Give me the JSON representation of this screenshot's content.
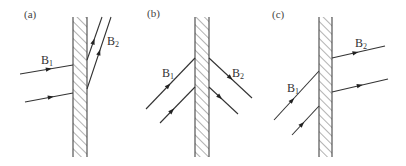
{
  "figure": {
    "width": 406,
    "height": 166,
    "colors": {
      "line": "#333333",
      "hatch": "#555555",
      "background": "#ffffff"
    }
  },
  "panels": [
    {
      "id": "a",
      "label": "(a)",
      "label_pos": [
        24,
        18
      ],
      "slab": {
        "x1": 73,
        "x2": 87,
        "y1": 17,
        "y2": 157
      },
      "incident_label": {
        "text": "B",
        "sub": "1",
        "pos": [
          41,
          64
        ]
      },
      "emergent_label": {
        "text": "B",
        "sub": "2",
        "pos": [
          107,
          45
        ]
      },
      "incident_rays": [
        {
          "from": [
            20,
            74
          ],
          "to": [
            73,
            65
          ],
          "arrow_t": 0.6
        },
        {
          "from": [
            25,
            102
          ],
          "to": [
            73,
            93
          ],
          "arrow_t": 0.6
        }
      ],
      "emergent_rays": [
        {
          "from": [
            87,
            60
          ],
          "to": [
            102,
            17
          ],
          "arrow_t": 0.5
        },
        {
          "from": [
            87,
            89
          ],
          "to": [
            111,
            17
          ],
          "arrow_t": 0.55
        }
      ]
    },
    {
      "id": "b",
      "label": "(b)",
      "label_pos": [
        147,
        17
      ],
      "slab": {
        "x1": 195,
        "x2": 209,
        "y1": 17,
        "y2": 157
      },
      "incident_label": {
        "text": "B",
        "sub": "1",
        "pos": [
          162,
          77
        ]
      },
      "emergent_label": {
        "text": "B",
        "sub": "2",
        "pos": [
          232,
          77
        ]
      },
      "incident_rays": [
        {
          "from": [
            146,
            109
          ],
          "to": [
            195,
            58
          ],
          "arrow_t": 0.5
        },
        {
          "from": [
            160,
            123
          ],
          "to": [
            195,
            87
          ],
          "arrow_t": 0.4
        }
      ],
      "emergent_rays": [
        {
          "from": [
            209,
            58
          ],
          "to": [
            252,
            98
          ],
          "arrow_t": 0.55
        },
        {
          "from": [
            209,
            87
          ],
          "to": [
            238,
            114
          ],
          "arrow_t": 0.45
        }
      ]
    },
    {
      "id": "c",
      "label": "(c)",
      "label_pos": [
        272,
        18
      ],
      "slab": {
        "x1": 319,
        "x2": 332,
        "y1": 17,
        "y2": 157
      },
      "incident_label": {
        "text": "B",
        "sub": "1",
        "pos": [
          287,
          92
        ]
      },
      "emergent_label": {
        "text": "B",
        "sub": "2",
        "pos": [
          355,
          47
        ]
      },
      "incident_rays": [
        {
          "from": [
            274,
            120
          ],
          "to": [
            319,
            71
          ],
          "arrow_t": 0.45
        },
        {
          "from": [
            292,
            135
          ],
          "to": [
            319,
            106
          ],
          "arrow_t": 0.45
        }
      ],
      "emergent_rays": [
        {
          "from": [
            332,
            58
          ],
          "to": [
            385,
            46
          ],
          "arrow_t": 0.5
        },
        {
          "from": [
            332,
            92
          ],
          "to": [
            388,
            79
          ],
          "arrow_t": 0.55
        }
      ]
    }
  ]
}
